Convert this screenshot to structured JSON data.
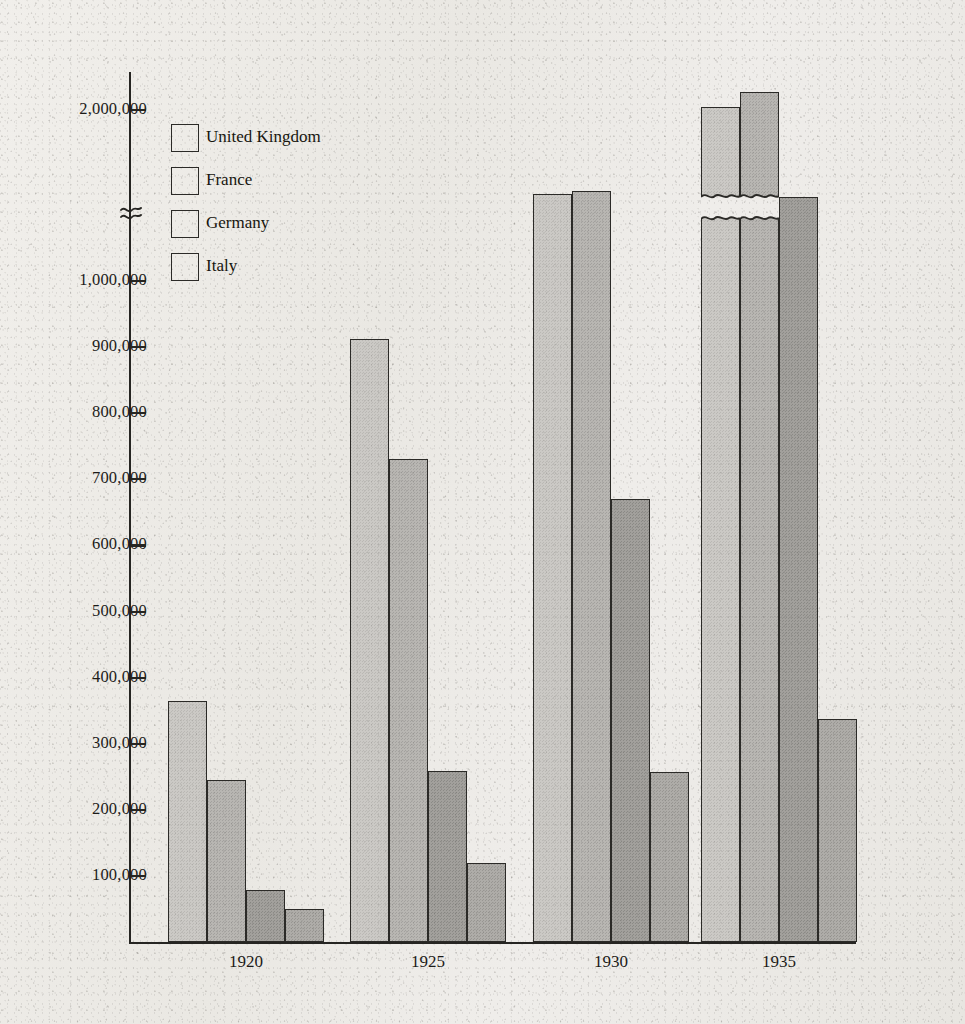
{
  "chart_data": {
    "type": "bar",
    "title": "",
    "subtitle": "",
    "xlabel": "",
    "ylabel": "",
    "categories": [
      "1920",
      "1925",
      "1930",
      "1935"
    ],
    "series": [
      {
        "name": "United Kingdom",
        "color": "#cbc9c5",
        "values": [
          365000,
          912000,
          1175000,
          2030000
        ]
      },
      {
        "name": "France",
        "color": "#b8b6b2",
        "values": [
          245000,
          730000,
          1205000,
          2180000
        ]
      },
      {
        "name": "Germany",
        "color": "#a2a09c",
        "values": [
          78000,
          258000,
          670000,
          1150000
        ]
      },
      {
        "name": "Italy",
        "color": "#aeaca8",
        "values": [
          50000,
          120000,
          257000,
          337000
        ]
      }
    ],
    "ytick_labels": [
      "100,000",
      "200,000",
      "300,000",
      "400,000",
      "500,000",
      "600,000",
      "700,000",
      "800,000",
      "900,000",
      "1,000,000",
      "2,000,000"
    ],
    "ytick_values": [
      100000,
      200000,
      300000,
      400000,
      500000,
      600000,
      700000,
      800000,
      900000,
      1000000,
      2000000
    ],
    "ylim": [
      0,
      2300000
    ],
    "axis_break": {
      "present": true,
      "between": [
        1000000,
        2000000
      ],
      "symbol": "squiggle"
    },
    "grid": false,
    "legend_position": "upper-left",
    "legend_entries": [
      "United Kingdom",
      "France",
      "Germany",
      "Italy"
    ],
    "bars_with_break_marker": [
      {
        "category": "1935",
        "series": "United Kingdom"
      },
      {
        "category": "1935",
        "series": "France"
      }
    ]
  },
  "axis": {
    "xtick_labels": [
      "1920",
      "1925",
      "1930",
      "1935"
    ]
  },
  "colors": {
    "paper": "#eceae5",
    "ink": "#1c1b19",
    "axis": "#262522",
    "bar_outline": "#2b2a27"
  }
}
